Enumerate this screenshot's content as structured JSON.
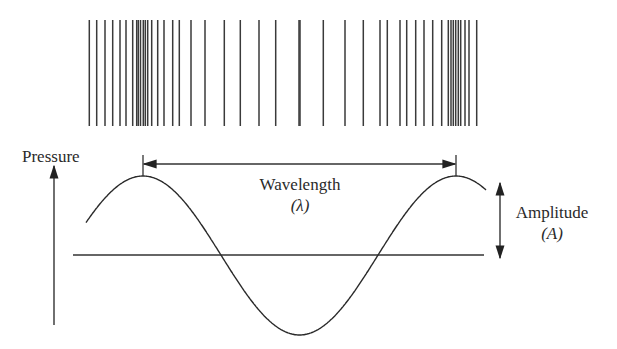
{
  "diagram": {
    "type": "sound-wave-pressure-diagram",
    "compression_bars": {
      "y_top": 20,
      "y_bottom": 126,
      "stroke_color": "#3a3a3a",
      "x_positions": [
        89.3,
        96.7,
        105,
        112.7,
        120,
        126,
        132.7,
        136.7,
        138.3,
        140.5,
        143.3,
        145.3,
        147.7,
        151.7,
        157.7,
        164,
        172.7,
        179.3,
        191,
        205,
        224.3,
        240.3,
        259,
        275.7,
        299,
        300,
        323.3,
        345,
        363.3,
        380,
        387.3,
        400,
        406.7,
        415.7,
        424,
        432.7,
        441.7,
        448.3,
        451,
        453.3,
        455.7,
        458.3,
        460.7,
        465,
        469,
        476.7
      ]
    },
    "axis": {
      "label": "Pressure",
      "arrow_x": 54,
      "arrow_top": 166,
      "arrow_bottom": 325
    },
    "baseline": {
      "x1": 73,
      "x2": 484,
      "y": 255
    },
    "wave": {
      "stroke_color": "#2a2a2a",
      "start_x": 86,
      "peak1_x": 143,
      "trough_x": 302,
      "peak2_x": 456,
      "end_x": 486,
      "peak_y": 176,
      "trough_y": 335,
      "baseline_y": 255
    },
    "wavelength": {
      "label": "Wavelength",
      "symbol": "(λ)",
      "arrow_y": 164,
      "x_start": 143,
      "x_end": 456
    },
    "amplitude": {
      "label": "Amplitude",
      "symbol": "(A)",
      "arrow_x": 500,
      "arrow_top": 183,
      "arrow_bottom": 258
    }
  }
}
